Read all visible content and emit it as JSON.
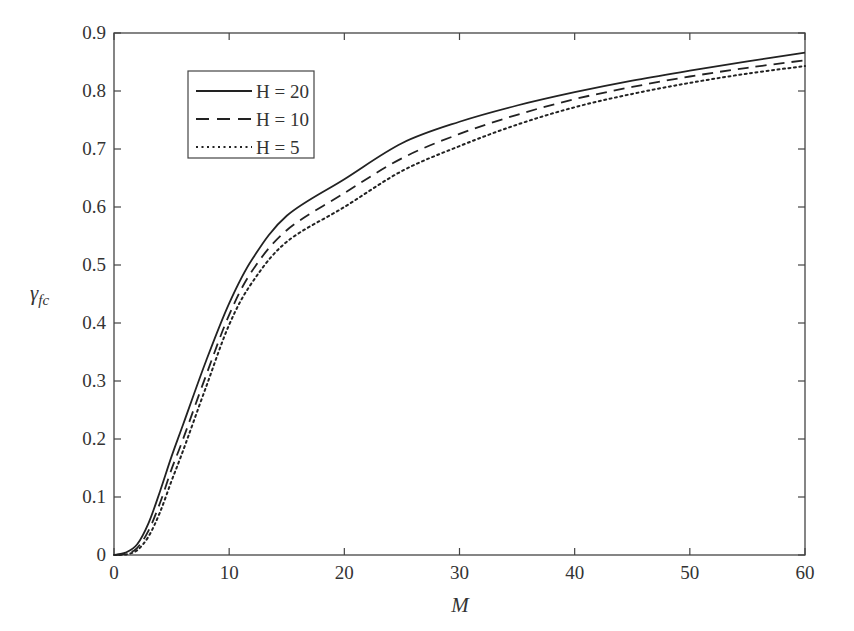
{
  "chart_data": {
    "type": "line",
    "title": "",
    "xlabel": "M",
    "ylabel": "γ",
    "ylabel_subscript": "fc",
    "xlim": [
      0,
      60
    ],
    "ylim": [
      0,
      0.9
    ],
    "xticks": [
      0,
      10,
      20,
      30,
      40,
      50,
      60
    ],
    "xtick_labels": [
      "0",
      "10",
      "20",
      "30",
      "40",
      "50",
      "60"
    ],
    "yticks": [
      0,
      0.1,
      0.2,
      0.3,
      0.4,
      0.5,
      0.6,
      0.7,
      0.8,
      0.9
    ],
    "ytick_labels": [
      "0",
      "0.1",
      "0.2",
      "0.3",
      "0.4",
      "0.5",
      "0.6",
      "0.7",
      "0.8",
      "0.9"
    ],
    "grid": false,
    "legend_position": "upper left",
    "x": [
      0,
      1,
      2,
      3,
      4,
      5,
      6,
      8,
      10,
      12,
      15,
      20,
      25,
      30,
      35,
      40,
      45,
      50,
      55,
      60
    ],
    "series": [
      {
        "name": "H = 20",
        "style": "solid",
        "values": [
          0,
          0.004,
          0.018,
          0.055,
          0.11,
          0.17,
          0.225,
          0.335,
          0.434,
          0.51,
          0.585,
          0.648,
          0.71,
          0.747,
          0.775,
          0.798,
          0.818,
          0.835,
          0.851,
          0.866
        ]
      },
      {
        "name": "H = 10",
        "style": "dashed",
        "values": [
          0,
          0.002,
          0.012,
          0.042,
          0.09,
          0.148,
          0.2,
          0.31,
          0.414,
          0.49,
          0.56,
          0.624,
          0.684,
          0.726,
          0.759,
          0.786,
          0.807,
          0.825,
          0.84,
          0.853
        ]
      },
      {
        "name": "H = 5",
        "style": "dotted",
        "values": [
          0,
          0.001,
          0.008,
          0.032,
          0.074,
          0.128,
          0.18,
          0.29,
          0.397,
          0.47,
          0.54,
          0.6,
          0.662,
          0.705,
          0.742,
          0.772,
          0.795,
          0.814,
          0.83,
          0.843
        ]
      }
    ]
  },
  "colors": {
    "axis": "#444444",
    "line": "#222222",
    "background": "#ffffff"
  }
}
